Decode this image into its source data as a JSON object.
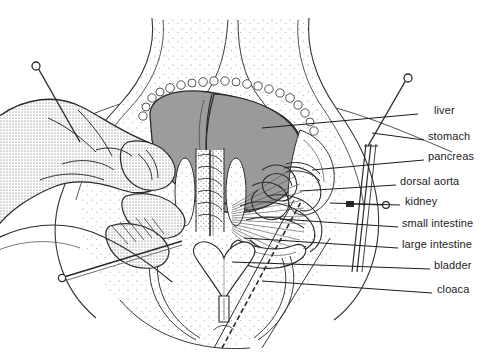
{
  "figure": {
    "background_color": "#ffffff",
    "ink_color": "#1c1c1c",
    "organ_fill_color": "#9a9a9a",
    "stipple_color": "#8d8d90",
    "hand_fill_color": "#c9c9c9"
  },
  "labels": [
    {
      "id": "liver",
      "text": "liver",
      "x": 434,
      "y": 111,
      "leader": {
        "x1": 418,
        "y1": 114,
        "x2": 262,
        "y2": 128
      }
    },
    {
      "id": "stomach",
      "text": "stomach",
      "x": 428,
      "y": 137,
      "leader": {
        "x1": 424,
        "y1": 140,
        "x2": 372,
        "y2": 133
      }
    },
    {
      "id": "pancreas",
      "text": "pancreas",
      "x": 428,
      "y": 157,
      "leader": {
        "x1": 424,
        "y1": 160,
        "x2": 312,
        "y2": 170
      }
    },
    {
      "id": "dorsal-aorta",
      "text": "dorsal aorta",
      "x": 400,
      "y": 182,
      "leader": {
        "x1": 396,
        "y1": 185,
        "x2": 300,
        "y2": 191
      }
    },
    {
      "id": "kidney",
      "text": "kidney",
      "x": 405,
      "y": 202,
      "leader": {
        "x1": 400,
        "y1": 205,
        "x2": 330,
        "y2": 203
      }
    },
    {
      "id": "small-intestine",
      "text": "small intestine",
      "x": 402,
      "y": 224,
      "leader": {
        "x1": 398,
        "y1": 227,
        "x2": 280,
        "y2": 219
      }
    },
    {
      "id": "large-intestine",
      "text": "large intestine",
      "x": 402,
      "y": 245,
      "leader": {
        "x1": 398,
        "y1": 248,
        "x2": 244,
        "y2": 238
      }
    },
    {
      "id": "bladder",
      "text": "bladder",
      "x": 434,
      "y": 266,
      "leader": {
        "x1": 430,
        "y1": 269,
        "x2": 232,
        "y2": 262
      }
    },
    {
      "id": "cloaca",
      "text": "cloaca",
      "x": 437,
      "y": 290,
      "leader": {
        "x1": 432,
        "y1": 293,
        "x2": 262,
        "y2": 281
      }
    }
  ],
  "pins": [
    {
      "id": "pin-top-left",
      "head_x": 36,
      "head_y": 66,
      "tip_x": 78,
      "tip_y": 140
    },
    {
      "id": "pin-top-right",
      "head_x": 408,
      "head_y": 78,
      "tip_x": 370,
      "tip_y": 144
    },
    {
      "id": "pin-kidney-probe",
      "head_x": 385,
      "head_y": 205,
      "tip_x": 352,
      "tip_y": 204
    },
    {
      "id": "pin-bottom-left",
      "head_x": 62,
      "head_y": 278,
      "tip_x": 180,
      "tip_y": 240
    },
    {
      "id": "pin-lower-center",
      "head_x": 222,
      "head_y": 348,
      "tip_x": 300,
      "tip_y": 205
    }
  ]
}
